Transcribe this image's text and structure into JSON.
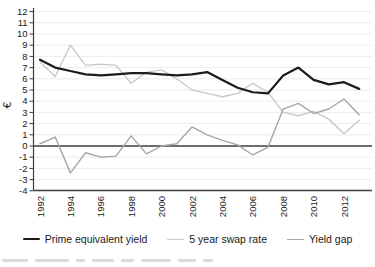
{
  "figure": {
    "background": "#ffffff",
    "axis_color": "#3d3d3d",
    "grid_color": "#ececec",
    "tick_label_color": "#1a1a1a"
  },
  "chart_data": {
    "type": "line",
    "title": "",
    "xlabel": "",
    "ylabel": "€",
    "ylim": [
      -4,
      12
    ],
    "y_tick_step": 1,
    "y_tick_labels": [
      "12",
      "11",
      "10",
      "9",
      "8",
      "7",
      "6",
      "5",
      "4",
      "3",
      "2",
      "1",
      "0",
      "-1",
      "-2",
      "-3",
      "-4"
    ],
    "x_tick_labels": [
      "1992",
      "1994",
      "1996",
      "1998",
      "2000",
      "2002",
      "2004",
      "2006",
      "2008",
      "2010",
      "2012"
    ],
    "x": [
      1992,
      1993,
      1994,
      1995,
      1996,
      1997,
      1998,
      1999,
      2000,
      2001,
      2002,
      2003,
      2004,
      2005,
      2006,
      2007,
      2008,
      2009,
      2010,
      2011,
      2012,
      2013
    ],
    "grid": "horizontal light gray lines at every unit",
    "zero_line": true,
    "legend_position": "bottom",
    "series": [
      {
        "name": "Prime equivalent yield",
        "color": "#1c1c1c",
        "stroke_width": 2.2,
        "values": [
          7.7,
          7.0,
          6.7,
          6.4,
          6.3,
          6.4,
          6.5,
          6.5,
          6.4,
          6.3,
          6.4,
          6.6,
          5.9,
          5.2,
          4.8,
          4.7,
          6.3,
          7.0,
          5.9,
          5.5,
          5.7,
          5.1
        ]
      },
      {
        "name": "5 year swap rate",
        "color": "#c9c9c9",
        "stroke_width": 1.4,
        "values": [
          7.5,
          6.2,
          9.0,
          7.2,
          7.3,
          7.2,
          5.6,
          6.6,
          6.8,
          6.0,
          5.0,
          4.7,
          4.4,
          4.7,
          5.6,
          4.8,
          3.0,
          2.7,
          3.1,
          2.4,
          1.1,
          2.3
        ]
      },
      {
        "name": "Yield gap",
        "color": "#a6a6a6",
        "stroke_width": 1.4,
        "values": [
          0.2,
          0.8,
          -2.4,
          -0.6,
          -1.0,
          -0.9,
          0.9,
          -0.7,
          0.0,
          0.2,
          1.7,
          1.0,
          0.5,
          0.1,
          -0.8,
          -0.1,
          3.3,
          3.8,
          2.9,
          3.3,
          4.2,
          2.8
        ]
      }
    ]
  }
}
